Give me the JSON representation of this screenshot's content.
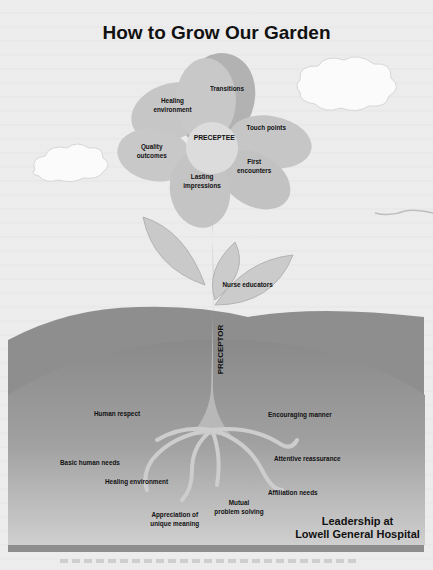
{
  "title": "How to Grow Our Garden",
  "center": "PRECEPTEE",
  "stem_label": "PRECEPTOR",
  "petals": [
    {
      "label": "Transitions"
    },
    {
      "label": "Healing environment",
      "lines": [
        "Healing",
        "environment"
      ]
    },
    {
      "label": "Touch points"
    },
    {
      "label": "Quality outcomes",
      "lines": [
        "Quality",
        "outcomes"
      ]
    },
    {
      "label": "First encounters",
      "lines": [
        "First",
        "encounters"
      ]
    },
    {
      "label": "Lasting impressions",
      "lines": [
        "Lasting",
        "impressions"
      ]
    }
  ],
  "leaf_label": "Nurse educators",
  "roots": [
    {
      "label": "Human respect"
    },
    {
      "label": "Encouraging manner"
    },
    {
      "label": "Basic human needs"
    },
    {
      "label": "Attentive reassurance"
    },
    {
      "label": "Healing environment"
    },
    {
      "label": "Affiliation needs"
    },
    {
      "label": "Mutual problem solving",
      "lines": [
        "Mutual",
        "problem solving"
      ]
    },
    {
      "label": "Appreciation of unique meaning",
      "lines": [
        "Appreciation of",
        "unique meaning"
      ]
    }
  ],
  "brand": {
    "line1": "Leadership at",
    "line2": "Lowell General Hospital"
  },
  "colors": {
    "petal": "#c4c4c4",
    "petal_dark": "#a8a8a8",
    "center": "#dedede",
    "ground": "#8d8d8d",
    "ground_light": "#b8b8b8",
    "stem": "#b4b4b4"
  }
}
